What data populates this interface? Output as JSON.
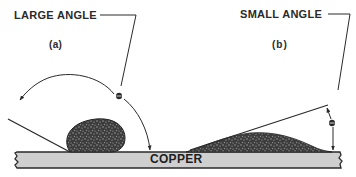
{
  "figure": {
    "panel_a": {
      "caption": "LARGE ANGLE",
      "label": "(a)",
      "angle_symbol": "θ",
      "description": "Non-wetting drop of solder with large contact angle on copper"
    },
    "panel_b": {
      "caption": "SMALL ANGLE",
      "label": "(b)",
      "angle_symbol": "θ",
      "description": "Wetting solder spread thin with small contact angle on copper"
    },
    "substrate": {
      "label": "COPPER"
    }
  },
  "colors": {
    "ink": "#2a2a2a",
    "substrate_fill": "#cfcfcf",
    "droplet_fill": "#4a4a4a",
    "background": "#ffffff"
  }
}
